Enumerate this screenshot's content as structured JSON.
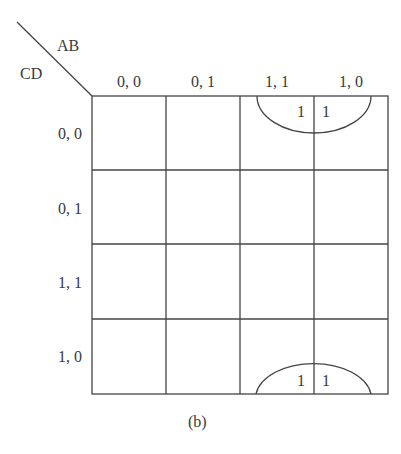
{
  "kmap": {
    "var_cols": "AB",
    "var_rows": "CD",
    "col_labels": [
      "0, 0",
      "0, 1",
      "1, 1",
      "1, 0"
    ],
    "row_labels": [
      "0, 0",
      "0, 1",
      "1, 1",
      "1, 0"
    ],
    "cells": [
      [
        "",
        "",
        "1",
        "1"
      ],
      [
        "",
        "",
        "",
        ""
      ],
      [
        "",
        "",
        "",
        ""
      ],
      [
        "",
        "",
        "1",
        "1"
      ]
    ],
    "groups": [
      {
        "cells": [
          [
            0,
            2
          ],
          [
            0,
            3
          ],
          [
            3,
            2
          ],
          [
            3,
            3
          ]
        ],
        "note": "wrap-around group drawn as half-ellipses at top and bottom"
      }
    ],
    "caption": "(b)"
  }
}
